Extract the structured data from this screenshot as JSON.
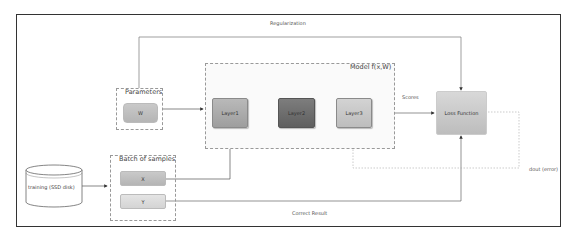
{
  "diagram": {
    "edges_labels": {
      "regularization": "Regularization",
      "scores": "Scores",
      "correct_result": "Correct Result",
      "dout": "dout (error)"
    },
    "groups": {
      "parameters": "Parameters",
      "model": "Model f(x,W)",
      "batch": "Batch of samples"
    },
    "nodes": {
      "w": "W",
      "layer1": "Layer1",
      "layer2": "Layer2",
      "layer3": "Layer3",
      "loss": "Loss Function",
      "x": "X",
      "y": "Y",
      "training": "training (SSD disk)"
    }
  }
}
